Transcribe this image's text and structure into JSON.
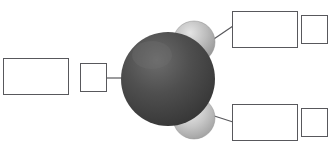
{
  "diagram": {
    "background_color": "#ffffff",
    "width": 334,
    "height": 151,
    "line_color": "#58585c",
    "box_border_color": "#58585c"
  },
  "model": {
    "central_atom": {
      "name": "central-atom-sphere",
      "color": "#4a4a4a",
      "highlight_color": "#6d6d6d",
      "shadow_color": "#2f2f2f",
      "cx": 168,
      "cy": 79,
      "r": 47
    },
    "atoms": [
      {
        "name": "upper-atom-sphere",
        "color": "#bdbdbd",
        "highlight_color": "#e2e2e2",
        "shadow_color": "#8d8d8d",
        "cx": 194,
        "cy": 42,
        "r": 21
      },
      {
        "name": "lower-atom-sphere",
        "color": "#c6c6c6",
        "highlight_color": "#e8e8e8",
        "shadow_color": "#959595",
        "cx": 194,
        "cy": 118,
        "r": 21
      }
    ]
  },
  "leader_lines": [
    {
      "name": "leader-line-left",
      "x1": 107,
      "y1": 78,
      "x2": 134,
      "y2": 78
    },
    {
      "name": "leader-line-top",
      "x1": 205,
      "y1": 45,
      "x2": 232,
      "y2": 26
    },
    {
      "name": "leader-line-bottom",
      "x1": 205,
      "y1": 113,
      "x2": 232,
      "y2": 122
    }
  ],
  "labels": {
    "left": {
      "name_box": {
        "value": "",
        "placeholder": ""
      },
      "symbol_box": {
        "value": "",
        "placeholder": ""
      }
    },
    "top_right": {
      "name_box": {
        "value": "",
        "placeholder": ""
      },
      "symbol_box": {
        "value": "",
        "placeholder": ""
      }
    },
    "bottom_right": {
      "name_box": {
        "value": "",
        "placeholder": ""
      },
      "symbol_box": {
        "value": "",
        "placeholder": ""
      }
    }
  }
}
